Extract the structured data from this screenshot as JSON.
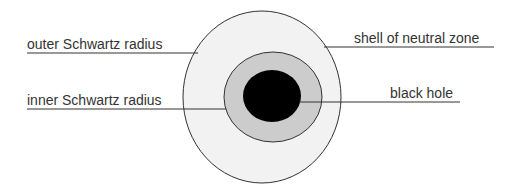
{
  "diagram": {
    "labels": {
      "outer": "outer Schwartz radius",
      "inner": "inner Schwartz radius",
      "shell": "shell of neutral zone",
      "black_hole": "black hole"
    },
    "colors": {
      "outer_fill": "#f2f2f2",
      "middle_fill": "#cccccc",
      "core_fill": "#000000",
      "stroke": "#333333"
    }
  }
}
